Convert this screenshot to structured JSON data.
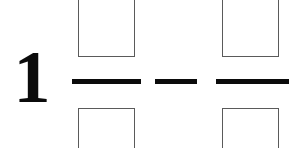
{
  "page": {
    "background_color": "#ffffff",
    "ink_color": "#0b0b0b",
    "box_border_color": "#5a5a5a",
    "width": 292,
    "height": 148
  },
  "expression": {
    "description": "Mixed number minus fraction with blank answer boxes",
    "whole_number": "1",
    "terms": [
      {
        "type": "fraction",
        "name": "first-fraction",
        "numerator_value": "",
        "numerator_placeholder": "",
        "denominator_value": "",
        "denominator_placeholder": "",
        "bar_label": "fraction-bar"
      },
      {
        "type": "operator",
        "name": "minus-operator",
        "symbol": "−",
        "label": "minus"
      },
      {
        "type": "fraction",
        "name": "second-fraction",
        "numerator_value": "",
        "numerator_placeholder": "",
        "denominator_value": "",
        "denominator_placeholder": "",
        "bar_label": "fraction-bar"
      }
    ]
  }
}
